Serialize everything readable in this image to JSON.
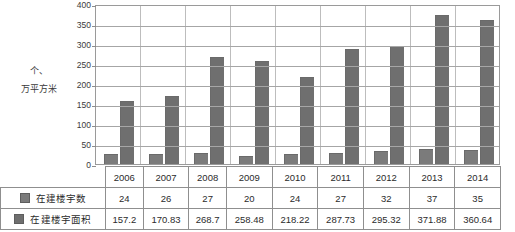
{
  "chart_data": {
    "type": "bar",
    "title": "",
    "subtitle": "",
    "xlabel": "",
    "ylabel": "个、万平方米",
    "ylim": [
      0,
      400
    ],
    "ytick_step": 50,
    "yticks": [
      400,
      350,
      300,
      250,
      200,
      150,
      100,
      50,
      0
    ],
    "grid": true,
    "legend_position": "table-left",
    "categories": [
      "2006",
      "2007",
      "2008",
      "2009",
      "2010",
      "2011",
      "2012",
      "2013",
      "2014"
    ],
    "series": [
      {
        "name": "在建楼宇数",
        "values": [
          24,
          26,
          27,
          20,
          24,
          27,
          32,
          37,
          35
        ],
        "color": "#7b7b7b"
      },
      {
        "name": "在建楼宇面积",
        "values": [
          157.2,
          170.83,
          268.7,
          258.48,
          218.22,
          287.73,
          295.32,
          371.88,
          360.64
        ],
        "color": "#6f6f6f"
      }
    ]
  },
  "axis_caption": {
    "line1": "个、",
    "line2": "万平方米"
  },
  "table": {
    "header_row": [
      "2006",
      "2007",
      "2008",
      "2009",
      "2010",
      "2011",
      "2012",
      "2013",
      "2014"
    ],
    "rows": [
      {
        "label": "在建楼宇数",
        "values": [
          "24",
          "26",
          "27",
          "20",
          "24",
          "27",
          "32",
          "37",
          "35"
        ]
      },
      {
        "label": "在建楼宇面积",
        "values": [
          "157.2",
          "170.83",
          "268.7",
          "258.48",
          "218.22",
          "287.73",
          "295.32",
          "371.88",
          "360.64"
        ]
      }
    ]
  },
  "colors": {
    "bar_series_1": "#7b7b7b",
    "bar_series_2": "#6f6f6f",
    "gridline": "#a6a6a6",
    "plot_border": "#9a9a9a",
    "table_border": "#8f8f8f",
    "text": "#2b2b2b"
  }
}
